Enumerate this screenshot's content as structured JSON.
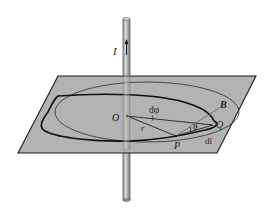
{
  "diagram": {
    "labels": {
      "current": "I",
      "origin": "O",
      "point_p": "P",
      "point_q": "Q",
      "field": "B",
      "angle_theta": "θ",
      "angle_dphi": "dφ",
      "radius": "r",
      "line_element": "dl"
    },
    "colors": {
      "plane_fill": "#b3b3b3",
      "plane_edge": "#1a1a1a",
      "rod_fill": "#a8a8a8",
      "rod_highlight": "#d6d6d6",
      "loop_stroke": "#1a1a1a",
      "circle_stroke": "#3a3a3a",
      "background": "#ffffff"
    }
  }
}
